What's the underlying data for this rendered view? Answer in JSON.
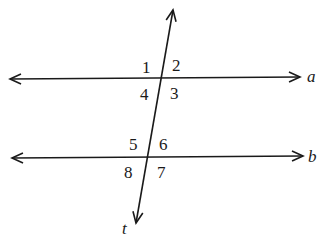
{
  "diagram": {
    "type": "parallel-lines-cut-by-transversal",
    "lines": [
      {
        "name": "a",
        "label": "a"
      },
      {
        "name": "b",
        "label": "b"
      }
    ],
    "transversal": {
      "name": "t",
      "label": "t"
    },
    "angles": {
      "a1": "1",
      "a2": "2",
      "a3": "3",
      "a4": "4",
      "a5": "5",
      "a6": "6",
      "a7": "7",
      "a8": "8"
    },
    "colors": {
      "stroke": "#1a1a1a",
      "background": "#ffffff"
    }
  }
}
